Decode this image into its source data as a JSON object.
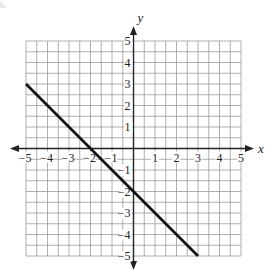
{
  "figure_label": "b.",
  "chart_data": {
    "type": "line",
    "title": "",
    "xlabel": "x",
    "ylabel": "y",
    "xlim": [
      -5,
      5
    ],
    "ylim": [
      -5,
      5
    ],
    "grid": true,
    "x_ticks": [
      -5,
      -4,
      -3,
      -2,
      -1,
      1,
      2,
      3,
      4,
      5
    ],
    "y_ticks": [
      -5,
      -4,
      -3,
      -2,
      -1,
      1,
      2,
      3,
      4,
      5
    ],
    "series": [
      {
        "name": "line",
        "x": [
          -5,
          3
        ],
        "y": [
          3,
          -5
        ],
        "slope": -1,
        "y_intercept": -2,
        "x_intercept": -2
      }
    ]
  },
  "colors": {
    "grid": "#9a9a9a",
    "axis": "#222222",
    "line": "#111111",
    "text": "#222222"
  }
}
